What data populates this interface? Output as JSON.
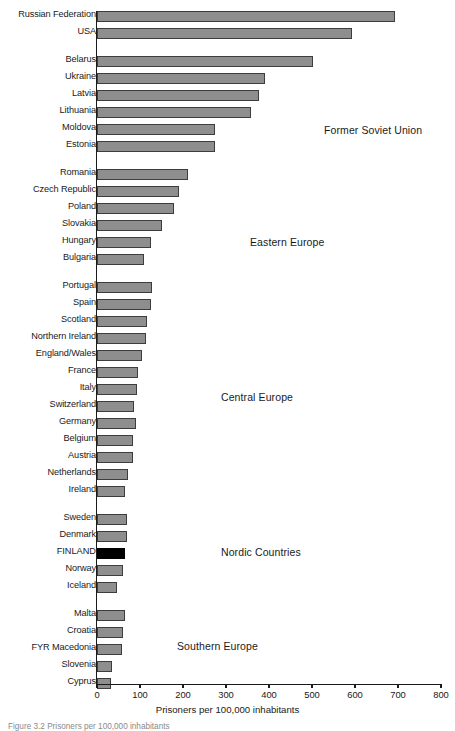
{
  "chart_data": {
    "type": "bar",
    "orientation": "horizontal",
    "title": "",
    "xlabel": "Prisoners per 100,000 inhabitants",
    "ylabel": "",
    "xlim": [
      0,
      800
    ],
    "xticks": [
      0,
      100,
      200,
      300,
      400,
      500,
      600,
      700,
      800
    ],
    "grid": false,
    "legend": "none",
    "bar_color": "#8e8e8e",
    "bar_edge_color": "#3d3d3d",
    "highlight_color": "#000000",
    "categories": [
      "Russian Federation",
      "USA",
      "Belarus",
      "Ukraine",
      "Latvia",
      "Lithuania",
      "Moldova",
      "Estonia",
      "Romania",
      "Czech Republic",
      "Poland",
      "Slovakia",
      "Hungary",
      "Bulgaria",
      "Portugal",
      "Spain",
      "Scotland",
      "Northern Ireland",
      "England/Wales",
      "France",
      "Italy",
      "Switzerland",
      "Germany",
      "Belgium",
      "Austria",
      "Netherlands",
      "Ireland",
      "Sweden",
      "Denmark",
      "FINLAND",
      "Norway",
      "Iceland",
      "Malta",
      "Croatia",
      "FYR Macedonia",
      "Slovenia",
      "Cyprus"
    ],
    "values": [
      693,
      593,
      502,
      390,
      377,
      358,
      275,
      275,
      212,
      190,
      179,
      151,
      126,
      110,
      128,
      126,
      116,
      114,
      104,
      95,
      93,
      86,
      91,
      84,
      84,
      72,
      65,
      70,
      70,
      65,
      60,
      47,
      65,
      61,
      58,
      36,
      32
    ],
    "groups": [
      {
        "label": "Former Soviet Union",
        "start": 2,
        "end": 7
      },
      {
        "label": "Eastern Europe",
        "start": 8,
        "end": 13
      },
      {
        "label": "Central Europe",
        "start": 14,
        "end": 26
      },
      {
        "label": "Nordic Countries",
        "start": 27,
        "end": 31
      },
      {
        "label": "Southern Europe",
        "start": 32,
        "end": 36
      }
    ],
    "highlighted_category": "FINLAND"
  },
  "bars": [
    {
      "label": "Russian Federation",
      "value": 693,
      "group": "top",
      "highlight": false
    },
    {
      "label": "USA",
      "value": 593,
      "group": "top",
      "highlight": false
    },
    {
      "label": "Belarus",
      "value": 502,
      "group": "fsu",
      "highlight": false
    },
    {
      "label": "Ukraine",
      "value": 390,
      "group": "fsu",
      "highlight": false
    },
    {
      "label": "Latvia",
      "value": 377,
      "group": "fsu",
      "highlight": false
    },
    {
      "label": "Lithuania",
      "value": 358,
      "group": "fsu",
      "highlight": false
    },
    {
      "label": "Moldova",
      "value": 275,
      "group": "fsu",
      "highlight": false
    },
    {
      "label": "Estonia",
      "value": 275,
      "group": "fsu",
      "highlight": false
    },
    {
      "label": "Romania",
      "value": 212,
      "group": "ee",
      "highlight": false
    },
    {
      "label": "Czech Republic",
      "value": 190,
      "group": "ee",
      "highlight": false
    },
    {
      "label": "Poland",
      "value": 179,
      "group": "ee",
      "highlight": false
    },
    {
      "label": "Slovakia",
      "value": 151,
      "group": "ee",
      "highlight": false
    },
    {
      "label": "Hungary",
      "value": 126,
      "group": "ee",
      "highlight": false
    },
    {
      "label": "Bulgaria",
      "value": 110,
      "group": "ee",
      "highlight": false
    },
    {
      "label": "Portugal",
      "value": 128,
      "group": "ce",
      "highlight": false
    },
    {
      "label": "Spain",
      "value": 126,
      "group": "ce",
      "highlight": false
    },
    {
      "label": "Scotland",
      "value": 116,
      "group": "ce",
      "highlight": false
    },
    {
      "label": "Northern Ireland",
      "value": 114,
      "group": "ce",
      "highlight": false
    },
    {
      "label": "England/Wales",
      "value": 104,
      "group": "ce",
      "highlight": false
    },
    {
      "label": "France",
      "value": 95,
      "group": "ce",
      "highlight": false
    },
    {
      "label": "Italy",
      "value": 93,
      "group": "ce",
      "highlight": false
    },
    {
      "label": "Switzerland",
      "value": 86,
      "group": "ce",
      "highlight": false
    },
    {
      "label": "Germany",
      "value": 91,
      "group": "ce",
      "highlight": false
    },
    {
      "label": "Belgium",
      "value": 84,
      "group": "ce",
      "highlight": false
    },
    {
      "label": "Austria",
      "value": 84,
      "group": "ce",
      "highlight": false
    },
    {
      "label": "Netherlands",
      "value": 72,
      "group": "ce",
      "highlight": false
    },
    {
      "label": "Ireland",
      "value": 65,
      "group": "ce",
      "highlight": false
    },
    {
      "label": "Sweden",
      "value": 70,
      "group": "nordic",
      "highlight": false
    },
    {
      "label": "Denmark",
      "value": 70,
      "group": "nordic",
      "highlight": false
    },
    {
      "label": "FINLAND",
      "value": 65,
      "group": "nordic",
      "highlight": true
    },
    {
      "label": "Norway",
      "value": 60,
      "group": "nordic",
      "highlight": false
    },
    {
      "label": "Iceland",
      "value": 47,
      "group": "nordic",
      "highlight": false
    },
    {
      "label": "Malta",
      "value": 65,
      "group": "se",
      "highlight": false
    },
    {
      "label": "Croatia",
      "value": 61,
      "group": "se",
      "highlight": false
    },
    {
      "label": "FYR Macedonia",
      "value": 58,
      "group": "se",
      "highlight": false
    },
    {
      "label": "Slovenia",
      "value": 36,
      "group": "se",
      "highlight": false
    },
    {
      "label": "Cyprus",
      "value": 32,
      "group": "se",
      "highlight": false
    }
  ],
  "group_labels": [
    {
      "text": "Former Soviet Union",
      "x": 324,
      "y": 124
    },
    {
      "text": "Eastern Europe",
      "x": 250,
      "y": 236
    },
    {
      "text": "Central Europe",
      "x": 221,
      "y": 391
    },
    {
      "text": "Nordic Countries",
      "x": 221,
      "y": 546
    },
    {
      "text": "Southern Europe",
      "x": 177,
      "y": 640
    }
  ],
  "axis": {
    "title": "Prisoners per 100,000 inhabitants",
    "ticks": [
      "0",
      "100",
      "200",
      "300",
      "400",
      "500",
      "600",
      "700",
      "800"
    ]
  },
  "caption": {
    "text": "Figure 3.2 Prisoners per 100,000 inhabitants"
  }
}
